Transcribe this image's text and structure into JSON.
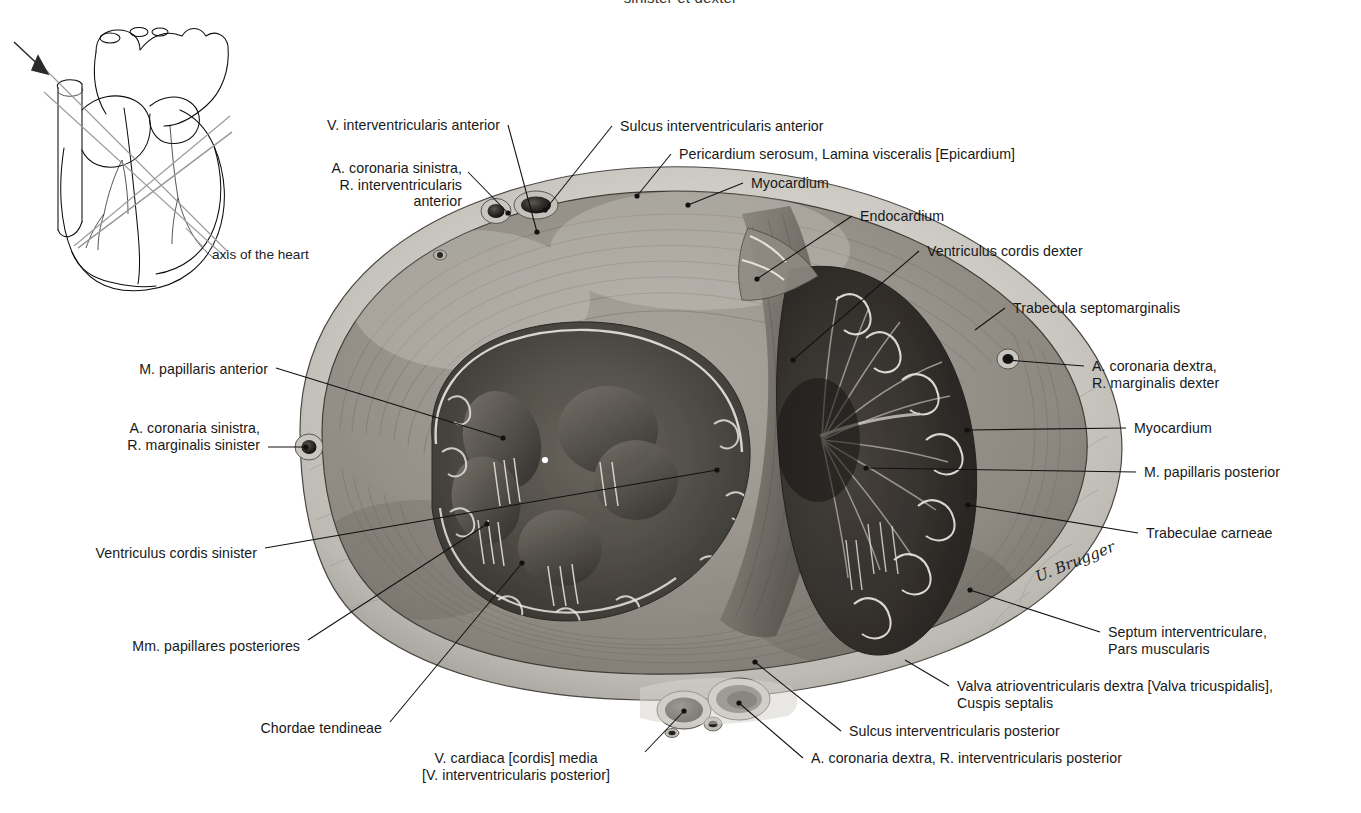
{
  "plate": {
    "title": "sinister et dexter",
    "signature": "U. Brugger",
    "inset_caption": "axis of the heart"
  },
  "labels": [
    {
      "id": "v-interventricularis-anterior",
      "lines": [
        "V. interventricularis anterior"
      ],
      "align": "right",
      "x": 500,
      "y": 117,
      "leader": [
        [
          508,
          125
        ],
        [
          537,
          232
        ]
      ],
      "dot": true
    },
    {
      "id": "a-coronaria-sinistra-r-iv-anterior",
      "lines": [
        "A. coronaria sinistra,",
        "R. interventricularis",
        "anterior"
      ],
      "align": "right",
      "x": 462,
      "y": 160,
      "leader": [
        [
          468,
          172
        ],
        [
          508,
          213
        ]
      ],
      "dot": true
    },
    {
      "id": "sulcus-interventricularis-anterior",
      "lines": [
        "Sulcus interventricularis anterior"
      ],
      "align": "left",
      "x": 620,
      "y": 118,
      "leader": [
        [
          612,
          126
        ],
        [
          545,
          210
        ]
      ],
      "dot": true
    },
    {
      "id": "pericardium-serosum",
      "lines": [
        "Pericardium serosum, Lamina visceralis [Epicardium]"
      ],
      "align": "left",
      "x": 679,
      "y": 146,
      "leader": [
        [
          671,
          154
        ],
        [
          637,
          196
        ]
      ],
      "dot": true
    },
    {
      "id": "myocardium-top",
      "lines": [
        "Myocardium"
      ],
      "align": "left",
      "x": 751,
      "y": 175,
      "leader": [
        [
          743,
          183
        ],
        [
          688,
          205
        ]
      ],
      "dot": true
    },
    {
      "id": "endocardium",
      "lines": [
        "Endocardium"
      ],
      "align": "left",
      "x": 860,
      "y": 208,
      "leader": [
        [
          852,
          216
        ],
        [
          757,
          279
        ]
      ],
      "dot": true
    },
    {
      "id": "ventriculus-cordis-dexter",
      "lines": [
        "Ventriculus cordis dexter"
      ],
      "align": "left",
      "x": 927,
      "y": 243,
      "leader": [
        [
          919,
          251
        ],
        [
          793,
          360
        ]
      ],
      "dot": true
    },
    {
      "id": "trabecula-septomarginalis",
      "lines": [
        "Trabecula septomarginalis"
      ],
      "align": "left",
      "x": 1013,
      "y": 300,
      "leader": [
        [
          1005,
          308
        ],
        [
          975,
          330
        ]
      ],
      "dot": false
    },
    {
      "id": "a-coronaria-dextra-r-marginalis-dexter",
      "lines": [
        "A. coronaria dextra,",
        "R. marginalis dexter"
      ],
      "align": "left",
      "x": 1092,
      "y": 358,
      "leader": [
        [
          1084,
          366
        ],
        [
          1007,
          360
        ]
      ],
      "dot": true
    },
    {
      "id": "myocardium-right",
      "lines": [
        "Myocardium"
      ],
      "align": "left",
      "x": 1134,
      "y": 420,
      "leader": [
        [
          1126,
          428
        ],
        [
          967,
          430
        ]
      ],
      "dot": true
    },
    {
      "id": "m-papillaris-posterior",
      "lines": [
        "M. papillaris posterior"
      ],
      "align": "left",
      "x": 1144,
      "y": 464,
      "leader": [
        [
          1136,
          472
        ],
        [
          866,
          468
        ]
      ],
      "dot": true
    },
    {
      "id": "trabeculae-carneae",
      "lines": [
        "Trabeculae carneae"
      ],
      "align": "left",
      "x": 1146,
      "y": 525,
      "leader": [
        [
          1138,
          533
        ],
        [
          968,
          505
        ]
      ],
      "dot": true
    },
    {
      "id": "septum-interventriculare",
      "lines": [
        "Septum interventriculare,",
        "Pars muscularis"
      ],
      "align": "left",
      "x": 1108,
      "y": 624,
      "leader": [
        [
          1100,
          632
        ],
        [
          970,
          590
        ]
      ],
      "dot": true
    },
    {
      "id": "valva-atrioventricularis-dextra",
      "lines": [
        "Valva atrioventricularis dextra [Valva tricuspidalis],",
        "Cuspis septalis"
      ],
      "align": "left",
      "x": 957,
      "y": 678,
      "leader": [
        [
          949,
          686
        ],
        [
          905,
          660
        ]
      ],
      "dot": false
    },
    {
      "id": "sulcus-interventricularis-posterior",
      "lines": [
        "Sulcus interventricularis posterior"
      ],
      "align": "left",
      "x": 849,
      "y": 723,
      "leader": [
        [
          841,
          731
        ],
        [
          755,
          662
        ]
      ],
      "dot": true
    },
    {
      "id": "a-coronaria-dextra-r-iv-posterior",
      "lines": [
        "A. coronaria dextra, R. interventricularis posterior"
      ],
      "align": "left",
      "x": 811,
      "y": 750,
      "leader": [
        [
          803,
          758
        ],
        [
          739,
          703
        ]
      ],
      "dot": true
    },
    {
      "id": "v-cardiaca-media",
      "lines": [
        "V. cardiaca [cordis] media",
        "[V. interventricularis posterior]"
      ],
      "align": "center",
      "x": 516,
      "y": 750,
      "leader": [
        [
          645,
          752
        ],
        [
          684,
          711
        ]
      ],
      "dot": true
    },
    {
      "id": "chordae-tendineae",
      "lines": [
        "Chordae tendineae"
      ],
      "align": "right",
      "x": 382,
      "y": 720,
      "leader": [
        [
          390,
          722
        ],
        [
          522,
          563
        ]
      ],
      "dot": true
    },
    {
      "id": "mm-papillares-posteriores",
      "lines": [
        "Mm. papillares posteriores"
      ],
      "align": "right",
      "x": 300,
      "y": 638,
      "leader": [
        [
          308,
          640
        ],
        [
          487,
          524
        ]
      ],
      "dot": true
    },
    {
      "id": "ventriculus-cordis-sinister",
      "lines": [
        "Ventriculus cordis sinister"
      ],
      "align": "right",
      "x": 257,
      "y": 545,
      "leader": [
        [
          265,
          548
        ],
        [
          717,
          470
        ]
      ],
      "dot": true
    },
    {
      "id": "a-coronaria-sinistra-r-marginalis-sinister",
      "lines": [
        "A. coronaria sinistra,",
        "R. marginalis sinister"
      ],
      "align": "right",
      "x": 260,
      "y": 420,
      "leader": [
        [
          268,
          447
        ],
        [
          306,
          447
        ]
      ],
      "dot": true
    },
    {
      "id": "m-papillaris-anterior",
      "lines": [
        "M. papillaris anterior"
      ],
      "align": "right",
      "x": 268,
      "y": 361,
      "leader": [
        [
          276,
          368
        ],
        [
          503,
          438
        ]
      ],
      "dot": true
    }
  ]
}
